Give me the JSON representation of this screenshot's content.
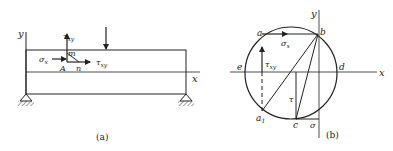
{
  "figure_a": {
    "caption": "(a)",
    "axis_x": "x",
    "axis_y": "y",
    "point_A": "A",
    "point_m": "m",
    "point_n": "n",
    "sigma_x": "σx",
    "tau_xy_vertical": "τxy",
    "tau_xy_horizontal": "τxy",
    "elements": [
      "simply supported beam",
      "concentrated load",
      "pin support left",
      "pin support right",
      "neutral axis"
    ]
  },
  "figure_b": {
    "caption": "(b)",
    "axis_x": "x",
    "axis_y": "y",
    "point_a": "a",
    "point_b": "b",
    "point_c": "c",
    "point_d": "d",
    "point_e": "e",
    "point_a1": "a1",
    "sigma_x": "σx",
    "tau_xy": "τxy",
    "tau": "τ",
    "sigma": "σ",
    "elements": [
      "Mohr's circle",
      "diameter a1-b",
      "chord b-c",
      "vertical tau segment",
      "dashed projection a-a1"
    ]
  }
}
